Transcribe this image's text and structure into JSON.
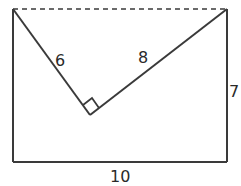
{
  "diagram": {
    "colors": {
      "stroke": "#3a3a3a",
      "background": "#ffffff",
      "text": "#2a2a2a"
    },
    "rectangle": {
      "width_label": "10",
      "height_label": "7",
      "top_edge_style": "dashed"
    },
    "triangle": {
      "left_leg_label": "6",
      "right_leg_label": "8",
      "right_angle_marker": true
    }
  }
}
